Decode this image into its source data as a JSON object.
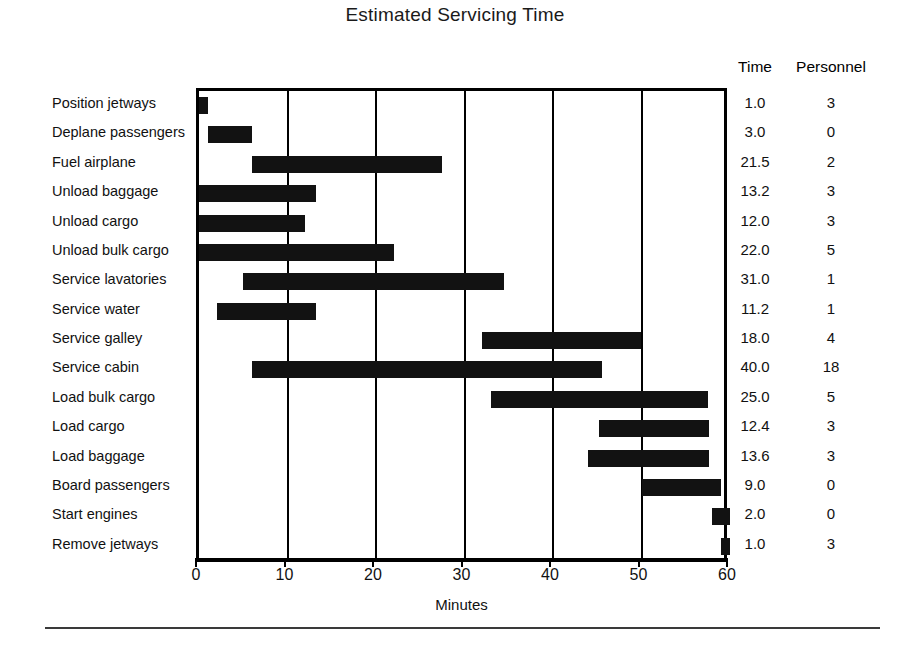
{
  "chart_data": {
    "type": "bar",
    "subtype": "gantt",
    "title": "Estimated Servicing Time",
    "xlabel": "Minutes",
    "ylabel": "",
    "xlim": [
      0,
      60
    ],
    "xticks": [
      0,
      10,
      20,
      30,
      40,
      50,
      60
    ],
    "xticklabels": [
      "0",
      "10",
      "20",
      "30",
      "40",
      "50",
      "60"
    ],
    "grid": true,
    "grid_axis": "x",
    "legend": "none",
    "bar_color": "#121212",
    "columns": [
      "Time",
      "Personnel"
    ],
    "categories": [
      "Position jetways",
      "Deplane passengers",
      "Fuel airplane",
      "Unload baggage",
      "Unload cargo",
      "Unload bulk cargo",
      "Service lavatories",
      "Service water",
      "Service galley",
      "Service cabin",
      "Load bulk cargo",
      "Load cargo",
      "Load baggage",
      "Board passengers",
      "Start engines",
      "Remove jetways"
    ],
    "tasks": [
      {
        "label": "Position jetways",
        "start": 0.0,
        "end": 1.0,
        "time": "1.0",
        "personnel": "3"
      },
      {
        "label": "Deplane passengers",
        "start": 1.0,
        "end": 6.0,
        "time": "3.0",
        "personnel": "0"
      },
      {
        "label": "Fuel airplane",
        "start": 6.0,
        "end": 27.5,
        "time": "21.5",
        "personnel": "2"
      },
      {
        "label": "Unload baggage",
        "start": 0.0,
        "end": 13.2,
        "time": "13.2",
        "personnel": "3"
      },
      {
        "label": "Unload cargo",
        "start": 0.0,
        "end": 12.0,
        "time": "12.0",
        "personnel": "3"
      },
      {
        "label": "Unload bulk cargo",
        "start": 0.0,
        "end": 22.0,
        "time": "22.0",
        "personnel": "5"
      },
      {
        "label": "Service lavatories",
        "start": 5.0,
        "end": 34.5,
        "time": "31.0",
        "personnel": "1"
      },
      {
        "label": "Service water",
        "start": 2.0,
        "end": 13.2,
        "time": "11.2",
        "personnel": "1"
      },
      {
        "label": "Service galley",
        "start": 32.0,
        "end": 50.0,
        "time": "18.0",
        "personnel": "4"
      },
      {
        "label": "Service cabin",
        "start": 6.0,
        "end": 45.5,
        "time": "40.0",
        "personnel": "18"
      },
      {
        "label": "Load bulk cargo",
        "start": 33.0,
        "end": 57.5,
        "time": "25.0",
        "personnel": "5"
      },
      {
        "label": "Load cargo",
        "start": 45.2,
        "end": 57.6,
        "time": "12.4",
        "personnel": "3"
      },
      {
        "label": "Load baggage",
        "start": 44.0,
        "end": 57.6,
        "time": "13.6",
        "personnel": "3"
      },
      {
        "label": "Board passengers",
        "start": 50.0,
        "end": 59.0,
        "time": "9.0",
        "personnel": "0"
      },
      {
        "label": "Start engines",
        "start": 58.0,
        "end": 60.0,
        "time": "2.0",
        "personnel": "0"
      },
      {
        "label": "Remove jetways",
        "start": 59.0,
        "end": 60.0,
        "time": "1.0",
        "personnel": "3"
      }
    ]
  },
  "header": {
    "title": "Estimated Servicing Time",
    "time_column_label": "Time",
    "personnel_column_label": "Personnel"
  },
  "axis": {
    "x_title": "Minutes",
    "ticks": [
      "0",
      "10",
      "20",
      "30",
      "40",
      "50",
      "60"
    ]
  }
}
